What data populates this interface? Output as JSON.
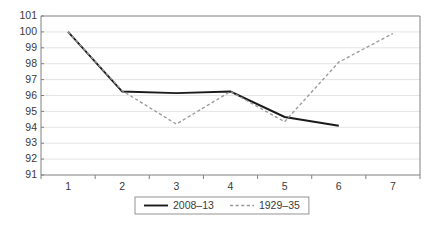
{
  "chart_data": {
    "type": "line",
    "title": "",
    "subtitle": "",
    "xlabel": "",
    "ylabel": "",
    "categories": [
      "1",
      "2",
      "3",
      "4",
      "5",
      "6",
      "7"
    ],
    "ylim": [
      91,
      101
    ],
    "ytick_labels": [
      "101",
      "100",
      "99",
      "98",
      "97",
      "96",
      "95",
      "94",
      "93",
      "92",
      "91"
    ],
    "ytick_values": [
      101,
      100,
      99,
      98,
      97,
      96,
      95,
      94,
      93,
      92,
      91
    ],
    "grid": true,
    "grid_orientation": "horizontal",
    "legend_position": "bottom-center",
    "series": [
      {
        "name": "2008–13",
        "style": "solid",
        "color": "#1a1a1a",
        "x": [
          "1",
          "2",
          "3",
          "4",
          "5",
          "6"
        ],
        "values": [
          100.0,
          96.25,
          96.15,
          96.25,
          94.65,
          94.1
        ]
      },
      {
        "name": "1929–35",
        "style": "dashed",
        "color": "#9a9a9a",
        "x": [
          "1",
          "2",
          "3",
          "4",
          "5",
          "6",
          "7"
        ],
        "values": [
          100.0,
          96.3,
          94.2,
          96.25,
          94.35,
          98.1,
          99.9
        ]
      }
    ]
  },
  "legend": {
    "entries": [
      {
        "label": "2008–13",
        "style": "solid"
      },
      {
        "label": "1929–35",
        "style": "dashed"
      }
    ]
  },
  "colors": {
    "series_solid": "#1a1a1a",
    "series_dashed": "#9a9a9a",
    "gridline": "#d9d9d9",
    "axis": "#808080",
    "text": "#3a3a3a",
    "background": "#ffffff"
  }
}
